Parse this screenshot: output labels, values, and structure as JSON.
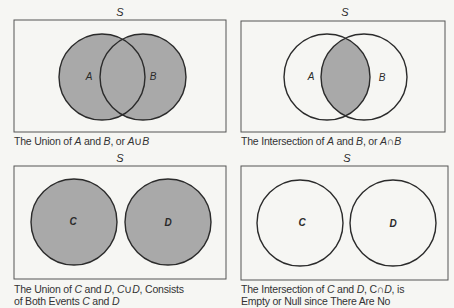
{
  "colors": {
    "background": "#f6f6f3",
    "shaded_fill": "#a9a9a9",
    "stroke": "#2b2b2b",
    "frame_stroke": "#555555"
  },
  "panels": [
    {
      "id": "union-ab",
      "sample_space_label": "S",
      "sets": [
        {
          "label": "A",
          "shaded": true
        },
        {
          "label": "B",
          "shaded": true
        }
      ],
      "shaded_region": "A ∪ B",
      "caption": [
        "The Union of A and B, or A∪B"
      ]
    },
    {
      "id": "intersection-ab",
      "sample_space_label": "S",
      "sets": [
        {
          "label": "A",
          "shaded": false
        },
        {
          "label": "B",
          "shaded": false
        }
      ],
      "shaded_region": "A ∩ B",
      "caption": [
        "The Intersection of A and B, or A∩B"
      ]
    },
    {
      "id": "union-cd",
      "sample_space_label": "S",
      "sets": [
        {
          "label": "C",
          "shaded": true
        },
        {
          "label": "D",
          "shaded": true
        }
      ],
      "shaded_region": "C ∪ D",
      "caption": [
        "The Union of C and D, C∪D, Consists",
        "of Both Events C and D"
      ]
    },
    {
      "id": "intersection-cd",
      "sample_space_label": "S",
      "sets": [
        {
          "label": "C",
          "shaded": false
        },
        {
          "label": "D",
          "shaded": false
        }
      ],
      "shaded_region": "none (empty)",
      "caption": [
        "The Intersection of C and D, C∩D, is",
        "Empty or Null since There Are No"
      ]
    }
  ],
  "captions": {
    "p1_line1_pre": "The Union of ",
    "p1_A": "A",
    "p1_and": " and ",
    "p1_B": "B",
    "p1_or": ", or ",
    "p1_A2": "A",
    "p1_op": "∪",
    "p1_B2": "B",
    "p2_line1_pre": "The Intersection of ",
    "p2_A": "A",
    "p2_and": " and ",
    "p2_B": "B",
    "p2_or": ", or ",
    "p2_A2": "A",
    "p2_op": "∩",
    "p2_B2": "B",
    "p3_line1_pre": "The Union of ",
    "p3_C": "C",
    "p3_and": " and ",
    "p3_D": "D",
    "p3_comma": ", ",
    "p3_C2": "C",
    "p3_op": "∪",
    "p3_D2": "D",
    "p3_rest": ", Consists",
    "p3_line2_pre": "of Both Events ",
    "p3_C3": "C",
    "p3_and2": " and ",
    "p3_D3": "D",
    "p4_line1_pre": "The Intersection of ",
    "p4_C": "C",
    "p4_and": " and ",
    "p4_D": "D",
    "p4_comma": ", C",
    "p4_op": "∩",
    "p4_D2": "D",
    "p4_rest": ", is",
    "p4_line2": "Empty or Null since There Are No"
  }
}
